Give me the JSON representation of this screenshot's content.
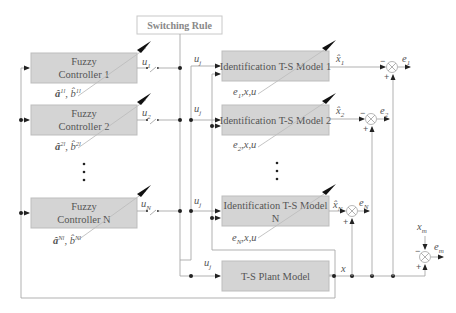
{
  "diagram": {
    "switching_rule": "Switching Rule",
    "controllers": [
      {
        "line1": "Fuzzy",
        "line2": "Controller 1",
        "output": "u",
        "output_sub": "1",
        "params": "â",
        "params_sup": "1l",
        "params_b": ", b̂",
        "params_b_sup": "1l"
      },
      {
        "line1": "Fuzzy",
        "line2": "Controller 2",
        "output": "u",
        "output_sub": "2",
        "params": "â",
        "params_sup": "2l",
        "params_b": ", b̂",
        "params_b_sup": "2l"
      },
      {
        "line1": "Fuzzy",
        "line2": "Controller N",
        "output": "u",
        "output_sub": "N",
        "params": "â",
        "params_sup": "Nl",
        "params_b": ", b̂",
        "params_b_sup": "Nl"
      }
    ],
    "ellipsis": "⋮",
    "models": [
      {
        "line1": "Identification T-S Model 1",
        "line2": "",
        "input": "u",
        "input_sub": "j",
        "output": "x̂",
        "output_sub": "1",
        "adapt": "e",
        "adapt_sub": "1",
        "adapt_rest": ",x,u",
        "error": "e",
        "error_sub": "1"
      },
      {
        "line1": "Identification T-S Model 2",
        "line2": "",
        "input": "u",
        "input_sub": "j",
        "output": "x̂",
        "output_sub": "2",
        "adapt": "e",
        "adapt_sub": "2",
        "adapt_rest": ",x,u",
        "error": "e",
        "error_sub": "2"
      },
      {
        "line1": "Identification T-S Model",
        "line2": "N",
        "input": "u",
        "input_sub": "j",
        "output": "x̂",
        "output_sub": "N",
        "adapt": "e",
        "adapt_sub": "N",
        "adapt_rest": ",x,u",
        "error": "e",
        "error_sub": "N"
      }
    ],
    "plant": {
      "label": "T-S Plant Model",
      "input": "u",
      "input_sub": "j",
      "output": "x"
    },
    "reference": {
      "label": "x",
      "label_sub": "m",
      "error": "e",
      "error_sub": "m"
    },
    "signs": {
      "minus": "−",
      "plus": "+"
    }
  }
}
